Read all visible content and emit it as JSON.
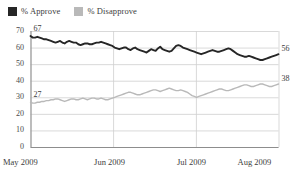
{
  "legend": {
    "position": "top-left",
    "items": [
      {
        "label": "% Approve",
        "color": "#262626",
        "icon": "square-swatch"
      },
      {
        "label": "% Disapprove",
        "color": "#b9b9b9",
        "icon": "square-swatch"
      }
    ]
  },
  "endpoint_labels": [
    {
      "name": "approve-start",
      "text": "67",
      "x_frac": 0.0,
      "value": 67
    },
    {
      "name": "approve-end",
      "text": "56",
      "x_frac": 1.0,
      "value": 56
    },
    {
      "name": "disapprove-start",
      "text": "27",
      "x_frac": 0.0,
      "value": 27
    },
    {
      "name": "disapprove-end",
      "text": "38",
      "x_frac": 1.0,
      "value": 38
    }
  ],
  "chart_data": {
    "type": "line",
    "title": "",
    "subtitle": "",
    "xlabel": "",
    "ylabel": "",
    "ylim": [
      0,
      70
    ],
    "yticks": [
      0,
      10,
      20,
      30,
      40,
      50,
      60,
      70
    ],
    "grid": true,
    "xlim": [
      0,
      100
    ],
    "xticks": [
      0,
      33.3,
      66.7,
      100
    ],
    "xticklabels": [
      "May 2009",
      "Jun 2009",
      "Jul 2009",
      "Aug 2009"
    ],
    "legend_position": "top-left",
    "annotations": [
      {
        "text": "67",
        "series": "% Approve",
        "at": "start"
      },
      {
        "text": "56",
        "series": "% Approve",
        "at": "end"
      },
      {
        "text": "27",
        "series": "% Disapprove",
        "at": "start"
      },
      {
        "text": "38",
        "series": "% Disapprove",
        "at": "end"
      }
    ],
    "series": [
      {
        "name": "% Approve",
        "color": "#262626",
        "values": [
          67,
          66,
          66,
          66.5,
          66,
          65.5,
          65,
          65,
          64.5,
          64,
          63.5,
          63,
          63.5,
          64,
          63,
          62.5,
          63.5,
          64,
          63.5,
          63,
          63,
          62,
          61.5,
          62,
          62.5,
          62.5,
          62,
          62,
          62.5,
          63,
          63,
          63.5,
          63,
          62.5,
          62,
          61.5,
          61,
          60,
          59.5,
          59,
          59.5,
          60,
          60,
          59,
          58.5,
          59.5,
          60,
          59,
          58.5,
          58,
          57.5,
          57,
          58,
          59,
          58.5,
          58,
          59.5,
          60.5,
          59,
          58.5,
          58,
          57.5,
          58,
          59.5,
          61,
          61.5,
          61,
          60,
          59.5,
          59,
          58.5,
          58,
          57.5,
          57,
          56.5,
          56,
          56.5,
          57,
          57.5,
          58,
          58.5,
          58,
          57.5,
          57.5,
          58,
          58.5,
          59,
          59.5,
          59,
          58,
          57,
          56,
          55.5,
          55,
          54.5,
          54.5,
          55,
          54.5,
          54,
          53.5,
          53,
          52.5,
          52.5,
          53,
          53.5,
          54,
          54.5,
          55,
          55.5,
          56
        ]
      },
      {
        "name": "% Disapprove",
        "color": "#b9b9b9",
        "values": [
          27,
          26.5,
          26.5,
          27,
          27,
          27.5,
          27.5,
          28,
          28,
          28.5,
          28.5,
          29,
          29,
          28.5,
          28,
          27.5,
          28,
          28.5,
          29,
          29,
          28.5,
          28.5,
          29,
          29.5,
          29,
          28.5,
          29,
          29.5,
          29.5,
          29,
          29,
          29.5,
          29,
          28.5,
          28.5,
          29,
          29.5,
          30,
          30.5,
          31,
          31.5,
          32,
          32.5,
          33,
          33,
          32.5,
          32,
          31.5,
          31.5,
          32,
          32.5,
          33,
          33.5,
          34,
          34.5,
          34.5,
          34,
          33.5,
          34,
          34.5,
          35,
          35.5,
          35,
          34.5,
          34,
          34,
          34.5,
          34,
          33.5,
          33,
          32,
          31,
          30.5,
          30,
          30.5,
          31,
          31.5,
          32,
          32.5,
          33,
          33.5,
          34,
          34.5,
          35,
          35,
          34.5,
          34,
          34,
          34.5,
          35,
          35.5,
          36,
          36.5,
          37,
          37.5,
          37.5,
          37,
          36.5,
          36.5,
          37,
          37.5,
          38,
          38,
          37.5,
          37,
          36.5,
          36.5,
          37,
          37.5,
          38
        ]
      }
    ]
  }
}
